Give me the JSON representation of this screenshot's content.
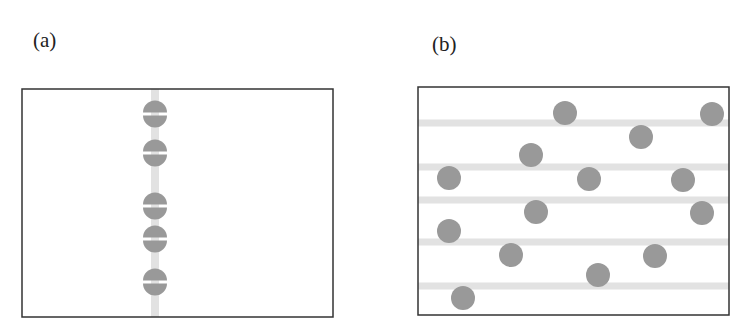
{
  "panels": [
    {
      "label": "(a)",
      "label_pos": [
        33,
        28
      ],
      "box": {
        "x": 22,
        "y": 89,
        "w": 311,
        "h": 228
      },
      "band": {
        "orientation": "vertical",
        "positions": [
          155
        ],
        "width": 8,
        "color": "#e2e2e2"
      },
      "particles": {
        "style": "split-disk",
        "radius": 12,
        "color": "#999999",
        "centers": [
          [
            155,
            114
          ],
          [
            155,
            153
          ],
          [
            155,
            206
          ],
          [
            155,
            239
          ],
          [
            155,
            282
          ]
        ]
      }
    },
    {
      "label": "(b)",
      "label_pos": [
        432,
        32
      ],
      "box": {
        "x": 418,
        "y": 87,
        "w": 311,
        "h": 228
      },
      "band": {
        "orientation": "horizontal",
        "positions": [
          123,
          167,
          200,
          242,
          286
        ],
        "width": 7,
        "color": "#e2e2e2"
      },
      "particles": {
        "style": "disk",
        "radius": 12,
        "color": "#999999",
        "centers": [
          [
            565,
            113
          ],
          [
            712,
            114
          ],
          [
            641,
            137
          ],
          [
            531,
            155
          ],
          [
            449,
            178
          ],
          [
            589,
            179
          ],
          [
            683,
            180
          ],
          [
            536,
            212
          ],
          [
            702,
            213
          ],
          [
            449,
            231
          ],
          [
            511,
            255
          ],
          [
            655,
            256
          ],
          [
            598,
            275
          ],
          [
            463,
            298
          ]
        ]
      }
    }
  ],
  "colors": {
    "frame": "#333333",
    "particle": "#999999",
    "band": "#e2e2e2",
    "background": "#ffffff"
  }
}
